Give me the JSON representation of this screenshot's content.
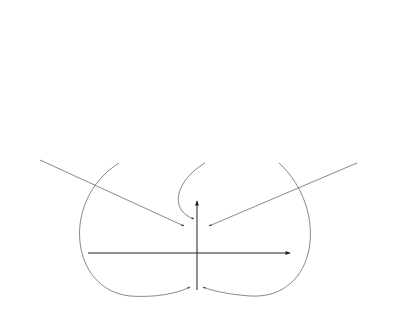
{
  "figure": {
    "top_row": {
      "label": "x(t)",
      "label_prefix": "x(",
      "label_var": "t",
      "label_suffix": ")",
      "axis_label": "t",
      "panels": [
        {
          "axis_x": 46,
          "burst_offset": -4
        },
        {
          "axis_x": 128,
          "burst_offset": -4
        },
        {
          "axis_x": 209,
          "burst_offset": -4
        },
        {
          "axis_x": 291,
          "burst_offset": -4
        },
        {
          "axis_x": 373,
          "burst_offset": -4
        }
      ]
    },
    "shifted_row": {
      "label": "x(t + τ)",
      "label_prefix": "x(",
      "label_var": "t",
      "label_suffix": " + τ)",
      "axis_label": "t",
      "panels": [
        {
          "axis_x": 46,
          "tau": 6
        },
        {
          "axis_x": 128,
          "tau": 3
        },
        {
          "axis_x": 209,
          "tau": 0
        },
        {
          "axis_x": 291,
          "tau": -3
        },
        {
          "axis_x": 373,
          "tau": -6
        }
      ]
    },
    "autocorrelation": {
      "label_main": "R",
      "label_sub": "x",
      "label_arg": "(τ)",
      "axis_label": "τ",
      "center_x": 197,
      "axis_y": 253,
      "marked_points": [
        {
          "name": "peak",
          "x": 197,
          "y": 219
        },
        {
          "name": "left-positive",
          "x": 186,
          "y": 228
        },
        {
          "name": "right-positive",
          "x": 207,
          "y": 228
        },
        {
          "name": "left-negative",
          "x": 192,
          "y": 285
        },
        {
          "name": "right-negative",
          "x": 201,
          "y": 285
        }
      ]
    },
    "caption": "Figure 3.11"
  }
}
